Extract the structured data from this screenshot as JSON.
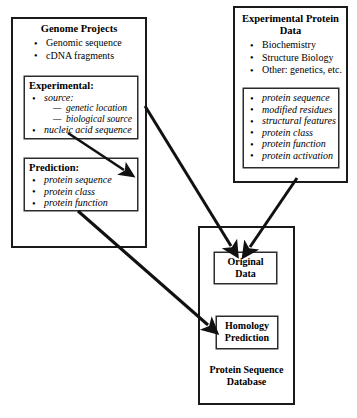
{
  "diagram": {
    "stroke_color": "#1a1a1a",
    "background_color": "#ffffff"
  },
  "genome_projects": {
    "title": "Genome Projects",
    "bullets": [
      "Genomic sequence",
      "cDNA fragments"
    ],
    "experimental": {
      "heading": "Experimental:",
      "bullets": [
        "source:",
        "nucleic acid sequence"
      ],
      "sub_items": [
        "genetic location",
        "biological source"
      ]
    },
    "prediction": {
      "heading": "Prediction:",
      "bullets": [
        "protein sequence",
        "protein class",
        "protein function"
      ]
    }
  },
  "experimental_protein_data": {
    "title_line1": "Experimental Protein",
    "title_line2": "Data",
    "bullets": [
      "Biochemistry",
      "Structure Biology",
      "Other: genetics, etc."
    ],
    "details": [
      "protein sequence",
      "modified residues",
      "structural features",
      "protein class",
      "protein function",
      "protein activation"
    ]
  },
  "protein_sequence_database": {
    "original_data_line1": "Original",
    "original_data_line2": "Data",
    "homology_line1": "Homology",
    "homology_line2": "Prediction",
    "caption_line1": "Protein Sequence",
    "caption_line2": "Database"
  },
  "arrows": [
    {
      "name": "experimental-to-prediction",
      "from": "Experimental",
      "to": "Prediction"
    },
    {
      "name": "experimental-to-original-data",
      "from": "Experimental",
      "to": "Original Data"
    },
    {
      "name": "protein-details-to-original-data",
      "from": "Experimental Protein Data",
      "to": "Original Data"
    },
    {
      "name": "prediction-to-homology-prediction",
      "from": "Prediction",
      "to": "Homology Prediction"
    }
  ]
}
